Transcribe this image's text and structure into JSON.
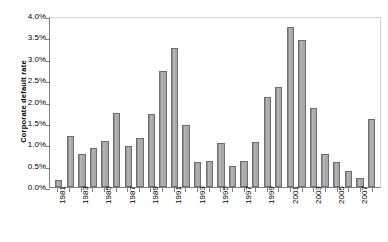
{
  "chart_data": {
    "type": "bar",
    "title": "",
    "xlabel": "",
    "ylabel": "Corporate default rate",
    "ylim": [
      0,
      4.0
    ],
    "ytick_labels": [
      "4.0%",
      "3.5%",
      "3.0%",
      "2.5%",
      "2.0%",
      "1.5%",
      "1.0%",
      "0.5%",
      "0.0%"
    ],
    "ytick_values": [
      4.0,
      3.5,
      3.0,
      2.5,
      2.0,
      1.5,
      1.0,
      0.5,
      0.0
    ],
    "grid": false,
    "legend": "none",
    "categories": [
      "1981",
      "1982",
      "1983",
      "1984",
      "1985",
      "1986",
      "1987",
      "1988",
      "1989",
      "1990",
      "1991",
      "1992",
      "1993",
      "1994",
      "1995",
      "1996",
      "1997",
      "1998",
      "1999",
      "2000",
      "2001",
      "2002",
      "2003",
      "2004",
      "2005",
      "2006",
      "2007",
      "2008"
    ],
    "xtick_labels_shown": [
      "1981",
      "",
      "1983",
      "",
      "1985",
      "",
      "1987",
      "",
      "1989",
      "",
      "1991",
      "",
      "1993",
      "",
      "1995",
      "",
      "1997",
      "",
      "1999",
      "",
      "2001",
      "",
      "2003",
      "",
      "2005",
      "",
      "2007",
      ""
    ],
    "values": [
      0.16,
      1.2,
      0.77,
      0.92,
      1.08,
      1.72,
      0.95,
      1.15,
      1.7,
      2.72,
      3.25,
      1.45,
      0.58,
      0.62,
      1.03,
      0.5,
      0.62,
      1.05,
      2.1,
      2.35,
      3.75,
      3.45,
      1.85,
      0.78,
      0.58,
      0.38,
      0.2,
      1.58
    ],
    "unit": "%",
    "bar_color": "#a8a8a8",
    "bar_border_color": "#6e6e6e",
    "axis_color": "#808080",
    "background_color": "#ffffff"
  }
}
